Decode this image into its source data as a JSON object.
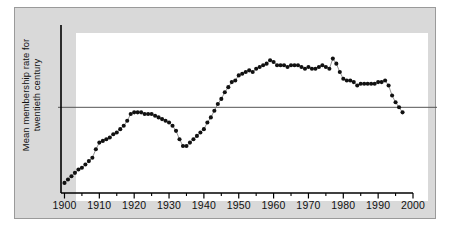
{
  "figure": {
    "background_color": "#ffffff",
    "panel_color": "#d9d9d9",
    "panel_border_color": "#9a9a9a",
    "canvas_color": "#ffffff"
  },
  "axes": {
    "y_axis_label": "Mean membership rate for\ntwentieth century",
    "y_axis_color": "#000000",
    "x_axis_color": "#000000",
    "reference_line_color": "#555555"
  },
  "chart_data": {
    "type": "line",
    "title": "",
    "subtitle": "",
    "xlabel": "",
    "ylabel": "Mean membership rate for twentieth century",
    "xlim": [
      1899,
      2000
    ],
    "ylim": [
      0,
      100
    ],
    "grid": false,
    "legend": "none",
    "marker": "filled-circle",
    "marker_color": "#111111",
    "line_color": "#777777",
    "annotations": [
      {
        "name": "mean-reference-line",
        "kind": "horizontal-line",
        "value": 51,
        "label": "Mean membership rate for twentieth century"
      }
    ],
    "x_major_ticks": [
      1900,
      1910,
      1920,
      1930,
      1940,
      1950,
      1960,
      1970,
      1980,
      1990,
      2000
    ],
    "x_major_tick_labels": [
      "1900",
      "1910",
      "1920",
      "1930",
      "1940",
      "1950",
      "1960",
      "1970",
      "1980",
      "1990",
      "2000"
    ],
    "x_minor_ticks": [
      1905,
      1915,
      1925,
      1935,
      1945,
      1955,
      1965,
      1975,
      1985,
      1995
    ],
    "y_ticks": [],
    "y_tick_labels": [],
    "series": [
      {
        "name": "Mean membership rate",
        "x": [
          1900,
          1901,
          1902,
          1903,
          1904,
          1905,
          1906,
          1907,
          1908,
          1909,
          1910,
          1911,
          1912,
          1913,
          1914,
          1915,
          1916,
          1917,
          1918,
          1919,
          1920,
          1921,
          1922,
          1923,
          1924,
          1925,
          1926,
          1927,
          1928,
          1929,
          1930,
          1931,
          1932,
          1933,
          1934,
          1935,
          1936,
          1937,
          1938,
          1939,
          1940,
          1941,
          1942,
          1943,
          1944,
          1945,
          1946,
          1947,
          1948,
          1949,
          1950,
          1951,
          1952,
          1953,
          1954,
          1955,
          1956,
          1957,
          1958,
          1959,
          1960,
          1961,
          1962,
          1963,
          1964,
          1965,
          1966,
          1967,
          1968,
          1969,
          1970,
          1971,
          1972,
          1973,
          1974,
          1975,
          1976,
          1977,
          1978,
          1979,
          1980,
          1981,
          1982,
          1983,
          1984,
          1985,
          1986,
          1987,
          1988,
          1989,
          1990,
          1991,
          1992,
          1993,
          1994,
          1995,
          1996,
          1997
        ],
        "values": [
          6,
          8,
          10,
          12,
          14,
          15,
          17,
          19,
          21,
          26,
          30,
          31,
          32,
          33,
          35,
          36,
          38,
          40,
          43,
          47,
          48,
          48,
          48,
          47,
          47,
          47,
          46,
          45,
          44,
          43,
          42,
          40,
          37,
          32,
          28,
          28,
          30,
          32,
          34,
          36,
          38,
          42,
          45,
          49,
          53,
          56,
          60,
          63,
          66,
          67,
          70,
          71,
          72,
          73,
          72,
          74,
          75,
          76,
          77,
          79,
          78,
          76,
          76,
          76,
          75,
          76,
          76,
          76,
          75,
          74,
          75,
          74,
          74,
          75,
          76,
          75,
          74,
          80,
          77,
          72,
          68,
          67,
          67,
          66,
          64,
          65,
          65,
          65,
          65,
          65,
          66,
          66,
          67,
          64,
          58,
          54,
          51,
          48
        ]
      }
    ]
  }
}
